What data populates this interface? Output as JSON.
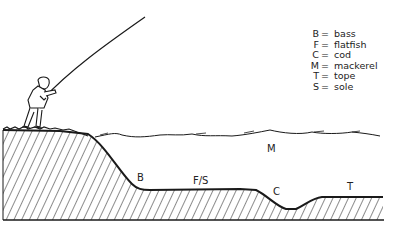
{
  "legend": [
    {
      "key": "B",
      "name": "bass"
    },
    {
      "key": "F",
      "name": "flatfish"
    },
    {
      "key": "C",
      "name": "cod"
    },
    {
      "key": "M",
      "name": "mackerel"
    },
    {
      "key": "T",
      "name": "tope"
    },
    {
      "key": "S",
      "name": "sole"
    }
  ],
  "legend_separator": "=",
  "labels": {
    "bass": "B",
    "flatfish_sole": "F/S",
    "cod": "C",
    "mackerel": "M",
    "tope": "T"
  },
  "colors": {
    "ink": "#1a1a1a",
    "background": "#ffffff"
  }
}
